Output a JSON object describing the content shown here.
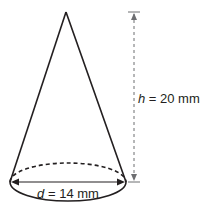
{
  "diagram": {
    "shape": "cone",
    "height_label": {
      "var": "h",
      "eq": " = 20 mm"
    },
    "diameter_label": {
      "var": "d",
      "eq": " = 14 mm"
    },
    "colors": {
      "stroke": "#231f20",
      "dimension": "#6d6e71",
      "background": "#ffffff"
    }
  }
}
